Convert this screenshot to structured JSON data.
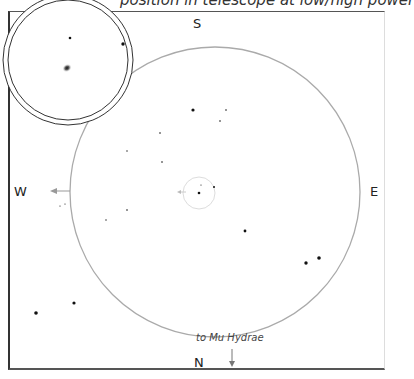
{
  "caption": "position in telescope at low/high power",
  "directions": {
    "south": "S",
    "north": "N",
    "west": "W",
    "east": "E"
  },
  "annotation": {
    "text": "to Mu Hydrae",
    "icon": "arrow-down-icon"
  },
  "colors": {
    "frame": "#333333",
    "circle": "#aaaaaa",
    "star": "#111111",
    "arrow": "#999999"
  },
  "finder_field": {
    "center": [
      215,
      192
    ],
    "radius": 145
  },
  "target_ring": {
    "center": [
      199,
      193
    ],
    "radius": 16
  },
  "inset": {
    "center": [
      68,
      60
    ],
    "outer_radius": 65,
    "inner_radius": 60
  },
  "stars": [
    {
      "x": 193,
      "y": 110,
      "r": 1.6
    },
    {
      "x": 226,
      "y": 110,
      "r": 0.8
    },
    {
      "x": 220,
      "y": 121,
      "r": 0.8
    },
    {
      "x": 160,
      "y": 133,
      "r": 0.8
    },
    {
      "x": 127,
      "y": 151,
      "r": 0.7
    },
    {
      "x": 162,
      "y": 162,
      "r": 0.8
    },
    {
      "x": 201,
      "y": 185,
      "r": 0.6
    },
    {
      "x": 199,
      "y": 193,
      "r": 1.3
    },
    {
      "x": 214,
      "y": 187,
      "r": 1.0
    },
    {
      "x": 127,
      "y": 210,
      "r": 0.8
    },
    {
      "x": 106,
      "y": 220,
      "r": 0.7
    },
    {
      "x": 65,
      "y": 204,
      "r": 0.6
    },
    {
      "x": 60,
      "y": 206,
      "r": 0.6
    },
    {
      "x": 245,
      "y": 231,
      "r": 1.4
    },
    {
      "x": 306,
      "y": 263,
      "r": 1.7
    },
    {
      "x": 319,
      "y": 258,
      "r": 1.8
    },
    {
      "x": 74,
      "y": 303,
      "r": 1.6
    },
    {
      "x": 36,
      "y": 313,
      "r": 1.8
    }
  ],
  "inset_stars": [
    {
      "x": 70,
      "y": 38,
      "r": 1.3
    },
    {
      "x": 123,
      "y": 44,
      "r": 1.7
    }
  ],
  "inset_object": {
    "x": 67,
    "y": 68,
    "label": "galaxy-object"
  }
}
